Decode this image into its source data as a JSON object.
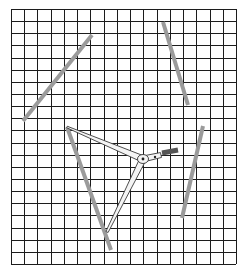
{
  "title": "Line segments on grid with compass",
  "colors": {
    "background": "#ffffff",
    "grid": "#1c1c1c",
    "segment": "#9b9b9b",
    "compass_body": "#f4f4f4",
    "compass_handle": "#555555"
  },
  "grid": {
    "x0": 11,
    "y0": 9,
    "x1": 236,
    "y1": 264,
    "columns": 17,
    "rows": 21
  },
  "segments": [
    {
      "name": "segment-upper-left",
      "x1": 23,
      "y1": 121,
      "x2": 92,
      "y2": 35
    },
    {
      "name": "segment-upper-right",
      "x1": 163,
      "y1": 22,
      "x2": 188,
      "y2": 105
    },
    {
      "name": "segment-lower-right",
      "x1": 203,
      "y1": 126,
      "x2": 182,
      "y2": 218
    },
    {
      "name": "segment-lower-left",
      "x1": 67,
      "y1": 127,
      "x2": 111,
      "y2": 250
    }
  ],
  "compass": {
    "hinge": {
      "x": 143,
      "y": 159
    },
    "pivot": {
      "x": 155,
      "y": 157
    },
    "leg_a_tip": {
      "x": 67,
      "y": 127
    },
    "leg_b_tip": {
      "x": 107,
      "y": 232
    },
    "handle": {
      "x1": 162,
      "y1": 153,
      "x2": 178,
      "y2": 150
    }
  }
}
